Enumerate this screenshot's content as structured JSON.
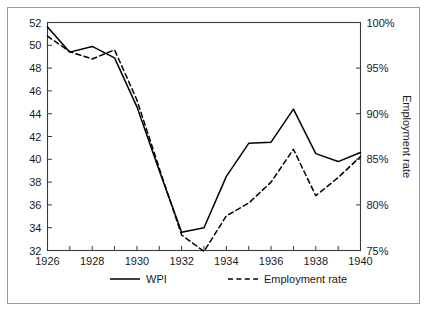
{
  "chart_data": {
    "type": "line",
    "title": "",
    "xlabel": "",
    "ylabel": "",
    "y2label": "Employment rate",
    "grid": false,
    "legend_position": "bottom",
    "x": [
      1926,
      1927,
      1928,
      1929,
      1930,
      1931,
      1932,
      1933,
      1934,
      1935,
      1936,
      1937,
      1938,
      1939,
      1940
    ],
    "xlim": [
      1926,
      1940
    ],
    "xticks": [
      1926,
      1927,
      1928,
      1929,
      1930,
      1931,
      1932,
      1933,
      1934,
      1935,
      1936,
      1937,
      1938,
      1939,
      1940
    ],
    "xticklabels": [
      "1926",
      "",
      "1928",
      "",
      "1930",
      "",
      "1932",
      "",
      "1934",
      "",
      "1936",
      "",
      "1938",
      "",
      "1940"
    ],
    "ylim": [
      32,
      52
    ],
    "yticks": [
      32,
      34,
      36,
      38,
      40,
      42,
      44,
      46,
      48,
      50,
      52
    ],
    "yticklabels": [
      "32",
      "34",
      "36",
      "38",
      "40",
      "42",
      "44",
      "46",
      "48",
      "50",
      "52"
    ],
    "y2lim": [
      75,
      100
    ],
    "y2ticks": [
      75,
      80,
      85,
      90,
      95,
      100
    ],
    "y2ticklabels": [
      "75%",
      "80%",
      "85%",
      "90%",
      "95%",
      "100%"
    ],
    "series": [
      {
        "name": "WPI",
        "axis": "left",
        "style": "solid",
        "color": "#000000",
        "values": [
          51.6,
          49.4,
          49.9,
          48.9,
          44.6,
          39.0,
          33.6,
          34.0,
          38.5,
          41.4,
          41.5,
          44.4,
          40.5,
          39.8,
          40.6
        ]
      },
      {
        "name": "Employment rate",
        "axis": "right",
        "style": "dashed",
        "color": "#000000",
        "values": [
          98.5,
          96.8,
          96.0,
          97.0,
          91.5,
          84.0,
          76.7,
          74.9,
          78.8,
          80.2,
          82.5,
          86.1,
          81.0,
          83.0,
          85.3
        ]
      }
    ]
  },
  "legend": {
    "items": [
      {
        "label": "WPI",
        "style": "solid"
      },
      {
        "label": "Employment rate",
        "style": "dashed"
      }
    ]
  },
  "axes": {
    "right_title": "Employment rate"
  }
}
